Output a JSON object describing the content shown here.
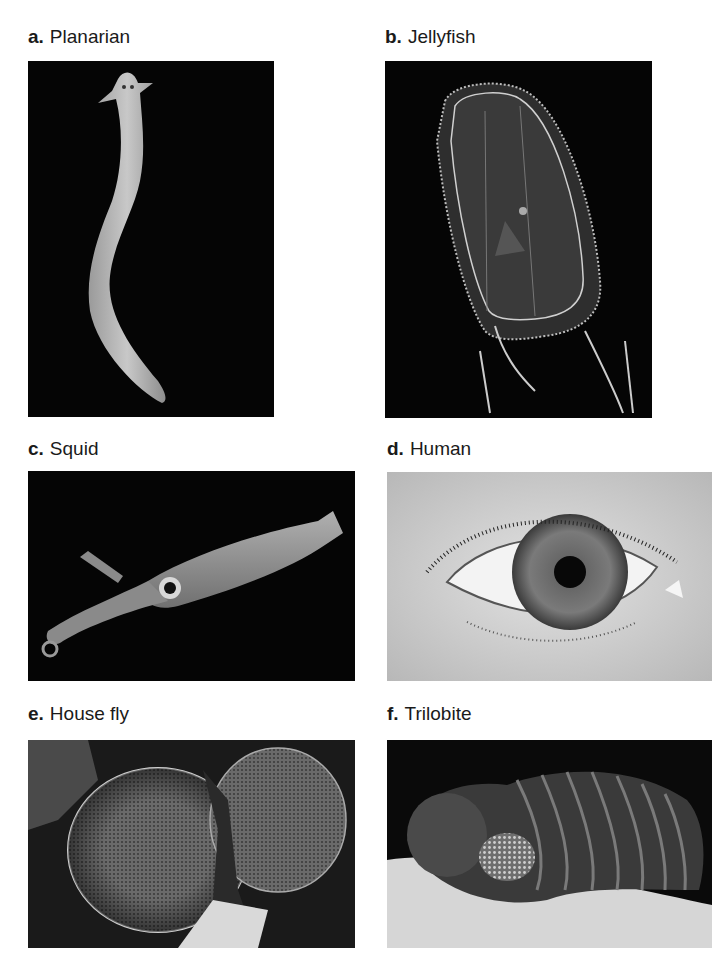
{
  "figure": {
    "panels": [
      {
        "letter": "a.",
        "name": "Planarian",
        "background": "#050505"
      },
      {
        "letter": "b.",
        "name": "Jellyfish",
        "background": "#050505"
      },
      {
        "letter": "c.",
        "name": "Squid",
        "background": "#050505"
      },
      {
        "letter": "d.",
        "name": "Human",
        "background": "#c9c9c9"
      },
      {
        "letter": "e.",
        "name": "House fly",
        "background": "#1a1a1a"
      },
      {
        "letter": "f.",
        "name": "Trilobite",
        "background": "#0a0a0a"
      }
    ]
  }
}
